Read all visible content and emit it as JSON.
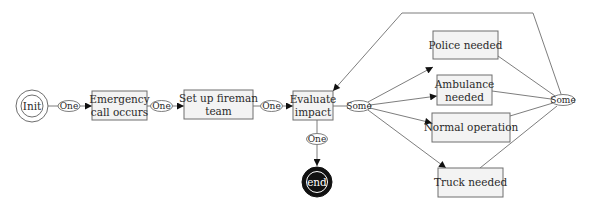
{
  "diagram": {
    "colors": {
      "box_fill": "#f3f3f3",
      "stroke": "#6e6e6e",
      "end_fill": "#111111"
    },
    "states": {
      "init": {
        "label": "Init"
      },
      "end": {
        "label": "end"
      }
    },
    "nodes": {
      "emergency": {
        "line1": "Emergency",
        "line2": "call occurs"
      },
      "fireman": {
        "line1": "Set up fireman",
        "line2": "team"
      },
      "evaluate": {
        "line1": "Evaluate",
        "line2": "impact"
      },
      "police": {
        "label": "Police needed"
      },
      "ambulance": {
        "line1": "Ambulance",
        "line2": "needed"
      },
      "normal": {
        "label": "Normal operation"
      },
      "truck": {
        "label": "Truck needed"
      }
    },
    "connectors": {
      "c1": "One",
      "c2": "One",
      "c3": "One",
      "c4": "One",
      "split": "Some",
      "join": "Some"
    }
  }
}
